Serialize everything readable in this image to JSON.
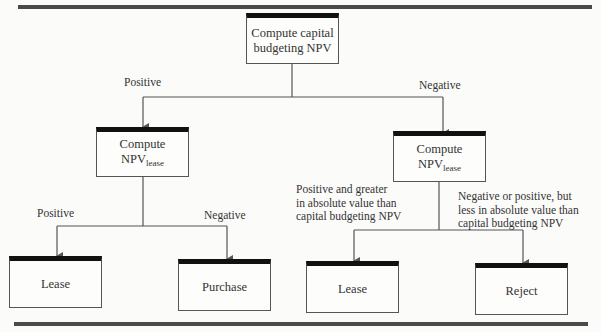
{
  "diagram": {
    "type": "decision-flowchart",
    "colors": {
      "line": "#555555",
      "box_top_bar": "#111111",
      "rule": "#4a4a4a",
      "text": "#333333"
    },
    "root": {
      "line1": "Compute capital",
      "line2": "budgeting NPV"
    },
    "left_branch": {
      "edge_label": "Positive",
      "node": {
        "line1": "Compute",
        "npv": "NPV",
        "sub": "lease"
      },
      "children": [
        {
          "edge_label": "Positive",
          "node": "Lease"
        },
        {
          "edge_label": "Negative",
          "node": "Purchase"
        }
      ]
    },
    "right_branch": {
      "edge_label": "Negative",
      "node": {
        "line1": "Compute",
        "npv": "NPV",
        "sub": "lease"
      },
      "children": [
        {
          "edge_label_lines": [
            "Positive and greater",
            "in absolute value than",
            "capital budgeting NPV"
          ],
          "node": "Lease"
        },
        {
          "edge_label_lines": [
            "Negative or positive, but",
            "less in absolute value than",
            "capital budgeting NPV"
          ],
          "node": "Reject"
        }
      ]
    }
  }
}
